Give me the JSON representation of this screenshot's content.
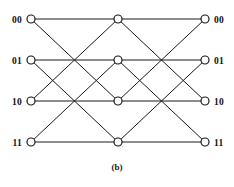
{
  "figure": {
    "caption": "(b)",
    "width": 234,
    "height": 187,
    "background_color": "#ffffff",
    "line_color": "#1a1a1a",
    "node_fill_color": "#ffffff",
    "node_radius": 4
  },
  "columns": [
    {
      "id": "input",
      "x": 31
    },
    {
      "id": "middle",
      "x": 118
    },
    {
      "id": "output",
      "x": 205
    }
  ],
  "rows": [
    {
      "index": 0,
      "y": 19
    },
    {
      "index": 1,
      "y": 60
    },
    {
      "index": 2,
      "y": 101
    },
    {
      "index": 3,
      "y": 142
    }
  ],
  "input_labels": [
    "00",
    "01",
    "10",
    "11"
  ],
  "output_labels": [
    "00",
    "01",
    "10",
    "11"
  ],
  "nodes": [
    {
      "id": "in-0",
      "column": "input",
      "row": 0,
      "x": 31,
      "y": 19,
      "label": "00"
    },
    {
      "id": "in-1",
      "column": "input",
      "row": 1,
      "x": 31,
      "y": 60,
      "label": "01"
    },
    {
      "id": "in-2",
      "column": "input",
      "row": 2,
      "x": 31,
      "y": 101,
      "label": "10"
    },
    {
      "id": "in-3",
      "column": "input",
      "row": 3,
      "x": 31,
      "y": 142,
      "label": "11"
    },
    {
      "id": "mid-0",
      "column": "middle",
      "row": 0,
      "x": 118,
      "y": 19,
      "label": ""
    },
    {
      "id": "mid-1",
      "column": "middle",
      "row": 1,
      "x": 118,
      "y": 60,
      "label": ""
    },
    {
      "id": "mid-2",
      "column": "middle",
      "row": 2,
      "x": 118,
      "y": 101,
      "label": ""
    },
    {
      "id": "mid-3",
      "column": "middle",
      "row": 3,
      "x": 118,
      "y": 142,
      "label": ""
    },
    {
      "id": "out-0",
      "column": "output",
      "row": 0,
      "x": 205,
      "y": 19,
      "label": "00"
    },
    {
      "id": "out-1",
      "column": "output",
      "row": 1,
      "x": 205,
      "y": 60,
      "label": "01"
    },
    {
      "id": "out-2",
      "column": "output",
      "row": 2,
      "x": 205,
      "y": 101,
      "label": "10"
    },
    {
      "id": "out-3",
      "column": "output",
      "row": 3,
      "x": 205,
      "y": 142,
      "label": "11"
    }
  ],
  "edges": [
    {
      "from": "in-0",
      "to": "mid-0",
      "x1": 31,
      "y1": 19,
      "x2": 118,
      "y2": 19
    },
    {
      "from": "in-0",
      "to": "mid-2",
      "x1": 31,
      "y1": 19,
      "x2": 118,
      "y2": 101
    },
    {
      "from": "in-1",
      "to": "mid-1",
      "x1": 31,
      "y1": 60,
      "x2": 118,
      "y2": 60
    },
    {
      "from": "in-1",
      "to": "mid-3",
      "x1": 31,
      "y1": 60,
      "x2": 118,
      "y2": 142
    },
    {
      "from": "in-2",
      "to": "mid-0",
      "x1": 31,
      "y1": 101,
      "x2": 118,
      "y2": 19
    },
    {
      "from": "in-2",
      "to": "mid-2",
      "x1": 31,
      "y1": 101,
      "x2": 118,
      "y2": 101
    },
    {
      "from": "in-3",
      "to": "mid-1",
      "x1": 31,
      "y1": 142,
      "x2": 118,
      "y2": 60
    },
    {
      "from": "in-3",
      "to": "mid-3",
      "x1": 31,
      "y1": 142,
      "x2": 118,
      "y2": 142
    },
    {
      "from": "mid-0",
      "to": "out-0",
      "x1": 118,
      "y1": 19,
      "x2": 205,
      "y2": 19
    },
    {
      "from": "mid-0",
      "to": "out-2",
      "x1": 118,
      "y1": 19,
      "x2": 205,
      "y2": 101
    },
    {
      "from": "mid-1",
      "to": "out-1",
      "x1": 118,
      "y1": 60,
      "x2": 205,
      "y2": 60
    },
    {
      "from": "mid-1",
      "to": "out-3",
      "x1": 118,
      "y1": 60,
      "x2": 205,
      "y2": 142
    },
    {
      "from": "mid-2",
      "to": "out-0",
      "x1": 118,
      "y1": 101,
      "x2": 205,
      "y2": 19
    },
    {
      "from": "mid-2",
      "to": "out-2",
      "x1": 118,
      "y1": 101,
      "x2": 205,
      "y2": 101
    },
    {
      "from": "mid-3",
      "to": "out-1",
      "x1": 118,
      "y1": 142,
      "x2": 205,
      "y2": 60
    },
    {
      "from": "mid-3",
      "to": "out-3",
      "x1": 118,
      "y1": 142,
      "x2": 205,
      "y2": 142
    }
  ]
}
